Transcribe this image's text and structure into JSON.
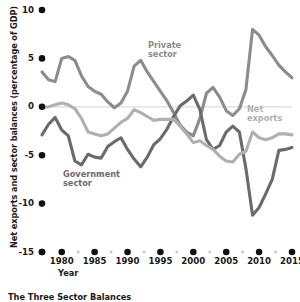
{
  "chart_data": {
    "type": "line",
    "title": "",
    "xlabel": "Year",
    "ylabel": "Net exports and sector balances (percentage of GDP)",
    "xlim": [
      1977,
      2015
    ],
    "ylim": [
      -15,
      10
    ],
    "ytick_labels": [
      "10",
      "5",
      "0",
      "-5",
      "-10",
      "-15"
    ],
    "ytick_values": [
      10,
      5,
      0,
      -5,
      -10,
      -15
    ],
    "xtick_labels": [
      "1980",
      "1985",
      "1990",
      "1995",
      "2000",
      "2005",
      "2010",
      "2015"
    ],
    "xtick_values": [
      1980,
      1985,
      1990,
      1995,
      2000,
      2005,
      2010,
      2015
    ],
    "grid": false,
    "zero_line": true,
    "legend_position": "inline-annotations",
    "x": [
      1977,
      1978,
      1979,
      1980,
      1981,
      1982,
      1983,
      1984,
      1985,
      1986,
      1987,
      1988,
      1989,
      1990,
      1991,
      1992,
      1993,
      1994,
      1995,
      1996,
      1997,
      1998,
      1999,
      2000,
      2001,
      2002,
      2003,
      2004,
      2005,
      2006,
      2007,
      2008,
      2009,
      2010,
      2011,
      2012,
      2013,
      2014,
      2015
    ],
    "series": [
      {
        "name": "Private sector",
        "color": "#8c8c8c",
        "values": [
          3.6,
          2.8,
          2.6,
          5.0,
          5.2,
          4.8,
          3.2,
          2.1,
          1.6,
          1.3,
          0.5,
          -0.1,
          0.4,
          1.6,
          4.2,
          4.8,
          3.6,
          2.6,
          1.6,
          0.6,
          -0.6,
          -1.9,
          -2.6,
          -3.0,
          -1.2,
          1.4,
          2.0,
          1.0,
          -0.4,
          -0.9,
          -0.2,
          1.8,
          8.0,
          7.4,
          6.2,
          5.3,
          4.3,
          3.6,
          3.0
        ]
      },
      {
        "name": "Government sector",
        "color": "#6b6b6b",
        "values": [
          -2.9,
          -1.8,
          -1.1,
          -2.4,
          -3.0,
          -5.6,
          -6.0,
          -4.9,
          -5.2,
          -5.3,
          -4.1,
          -3.6,
          -3.2,
          -4.4,
          -5.4,
          -6.2,
          -5.2,
          -3.9,
          -3.3,
          -2.3,
          -1.0,
          0.1,
          0.6,
          1.2,
          -0.3,
          -3.4,
          -4.4,
          -4.0,
          -2.6,
          -2.0,
          -2.6,
          -6.4,
          -11.2,
          -10.4,
          -9.0,
          -7.5,
          -4.5,
          -4.4,
          -4.2
        ]
      },
      {
        "name": "Net exports",
        "color": "#b0b0b0",
        "values": [
          -0.1,
          0.0,
          0.2,
          0.4,
          0.2,
          -0.2,
          -1.2,
          -2.6,
          -2.8,
          -3.0,
          -2.8,
          -2.2,
          -1.6,
          -1.2,
          -0.3,
          -0.6,
          -1.0,
          -1.4,
          -1.3,
          -1.3,
          -1.3,
          -2.0,
          -2.8,
          -3.7,
          -3.5,
          -4.0,
          -4.4,
          -5.1,
          -5.6,
          -5.7,
          -4.9,
          -4.6,
          -2.6,
          -3.2,
          -3.4,
          -3.2,
          -2.8,
          -2.8,
          -2.9
        ]
      }
    ],
    "annotations": [
      {
        "name": "private-sector-label",
        "text": "Private\nsector",
        "line1": "Private",
        "line2": "sector",
        "color": "#8c8c8c",
        "x": 148,
        "y": 41
      },
      {
        "name": "government-sector-label",
        "text": "Government\nsector",
        "line1": "Government",
        "line2": "sector",
        "color": "#6b6b6b",
        "x": 63,
        "y": 170
      },
      {
        "name": "net-exports-label",
        "text": "Net\nexports",
        "line1": "Net",
        "line2": "exports",
        "color": "#b0b0b0",
        "x": 247,
        "y": 105
      }
    ]
  },
  "caption": {
    "text": "The Three Sector Balances"
  }
}
